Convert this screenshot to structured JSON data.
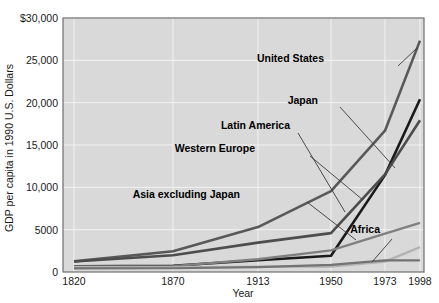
{
  "chart_data": {
    "type": "line",
    "title": "",
    "xlabel": "Year",
    "ylabel": "GDP per capita in 1990 U.S. Dollars",
    "x": [
      1820,
      1870,
      1913,
      1950,
      1973,
      1998
    ],
    "x_tick_labels": [
      "1820",
      "1870",
      "1913",
      "1950",
      "1973",
      "1998"
    ],
    "y_tick_labels": [
      "$30,000",
      "25,000",
      "20,000",
      "15,000",
      "10,000",
      "5000",
      "0"
    ],
    "y_tick_values": [
      30000,
      25000,
      20000,
      15000,
      10000,
      5000,
      0
    ],
    "ylim": [
      0,
      30000
    ],
    "grid": "horizontal-and-vertical",
    "legend_position": "inline-annotations",
    "series": [
      {
        "name": "United States",
        "color": "#595959",
        "width": 2.6,
        "values": [
          1257,
          2445,
          5301,
          9561,
          16689,
          27331
        ]
      },
      {
        "name": "Japan",
        "color": "#1a1a1a",
        "width": 2.6,
        "values": [
          669,
          737,
          1387,
          1926,
          11439,
          20413
        ]
      },
      {
        "name": "Western Europe",
        "color": "#4d4d4d",
        "width": 2.6,
        "values": [
          1232,
          1974,
          3473,
          4594,
          11534,
          17921
        ]
      },
      {
        "name": "Latin America",
        "color": "#808080",
        "width": 2.4,
        "values": [
          665,
          698,
          1511,
          2554,
          4531,
          5795
        ]
      },
      {
        "name": "Asia excluding Japan",
        "color": "#b3b3b3",
        "width": 2.4,
        "values": [
          575,
          543,
          640,
          635,
          1231,
          2936
        ]
      },
      {
        "name": "Africa",
        "color": "#737373",
        "width": 2.2,
        "values": [
          418,
          444,
          585,
          852,
          1365,
          1368
        ]
      }
    ],
    "annotations": [
      {
        "label": "United States",
        "x": 324,
        "y": 62
      },
      {
        "label": "Japan",
        "x": 318,
        "y": 104
      },
      {
        "label": "Latin America",
        "x": 290,
        "y": 129
      },
      {
        "label": "Western Europe",
        "x": 255,
        "y": 152
      },
      {
        "label": "Asia excluding Japan",
        "x": 240,
        "y": 198
      },
      {
        "label": "Africa",
        "x": 380,
        "y": 233
      }
    ]
  }
}
